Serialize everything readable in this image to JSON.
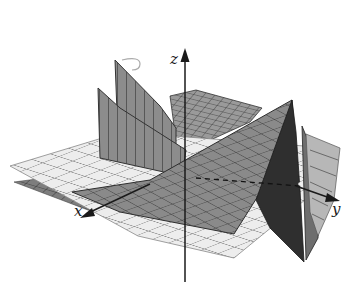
{
  "figure": {
    "type": "3d-surface-plot",
    "axes": {
      "x": {
        "label": "x"
      },
      "y": {
        "label": "y"
      },
      "z": {
        "label": "z"
      }
    },
    "colors": {
      "background": "#ffffff",
      "plane_light": "#ececec",
      "plane_grid": "#8a8a8a",
      "surface_mid": "#8e8e8e",
      "surface_dark": "#5a5a5a",
      "surface_darkest": "#2e2e2e",
      "axis": "#1a1a1a"
    },
    "annotations": [
      {
        "kind": "rotation-arrow",
        "description": "curved arrow near top-left fin"
      }
    ]
  }
}
